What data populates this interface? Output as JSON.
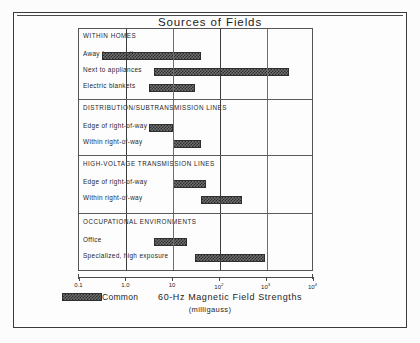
{
  "figure": {
    "title": "Sources of Fields",
    "axis_title": "60-Hz  Magnetic  Field  Strengths",
    "axis_units": "(milligauss)",
    "legend_label": "Common",
    "swatch_color": "#2b2b2b"
  },
  "chart_data": {
    "type": "bar",
    "orientation": "horizontal-range",
    "title": "Sources of Fields",
    "xlabel": "60-Hz Magnetic Field Strengths (milligauss)",
    "ylabel": "",
    "xscale": "log",
    "xlim": [
      0.1,
      10000
    ],
    "grid": true,
    "legend": {
      "label": "Common",
      "position": "bottom-left"
    },
    "tick_values": [
      0.1,
      1.0,
      10,
      100,
      1000,
      10000
    ],
    "tick_labels": [
      "0.1",
      "1.0",
      "10",
      "10²",
      "10³",
      "10⁴"
    ],
    "groups": [
      {
        "name": "WITHIN HOMES",
        "items": [
          {
            "label": "Away from appliances",
            "low": 0.3,
            "high": 40
          },
          {
            "label": "Next to appliances",
            "low": 4,
            "high": 3000
          },
          {
            "label": "Electric blankets",
            "low": 3,
            "high": 30
          }
        ]
      },
      {
        "name": "DISTRIBUTION/SUBTRANSMISSION LINES",
        "items": [
          {
            "label": "Edge of right-of-way",
            "low": 3,
            "high": 10
          },
          {
            "label": "Within right-of-way",
            "low": 10,
            "high": 40
          }
        ]
      },
      {
        "name": "HIGH-VOLTAGE TRANSMISSION LINES",
        "items": [
          {
            "label": "Edge of right-of-way",
            "low": 10,
            "high": 50
          },
          {
            "label": "Within right-of-way",
            "low": 40,
            "high": 300
          }
        ]
      },
      {
        "name": "OCCUPATIONAL ENVIRONMENTS",
        "items": [
          {
            "label": "Office",
            "low": 4,
            "high": 20
          },
          {
            "label": "Specialized, high exposure",
            "low": 30,
            "high": 900
          }
        ]
      }
    ]
  }
}
